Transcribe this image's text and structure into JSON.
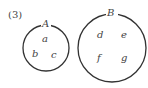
{
  "problem_number": "(3)",
  "sets": [
    {
      "name": "A",
      "elements": [
        "a",
        "b",
        "c"
      ]
    },
    {
      "name": "B",
      "elements": [
        "d",
        "e",
        "f",
        "g"
      ]
    }
  ],
  "colors": {
    "stroke": "#333333",
    "text": "#444444"
  }
}
